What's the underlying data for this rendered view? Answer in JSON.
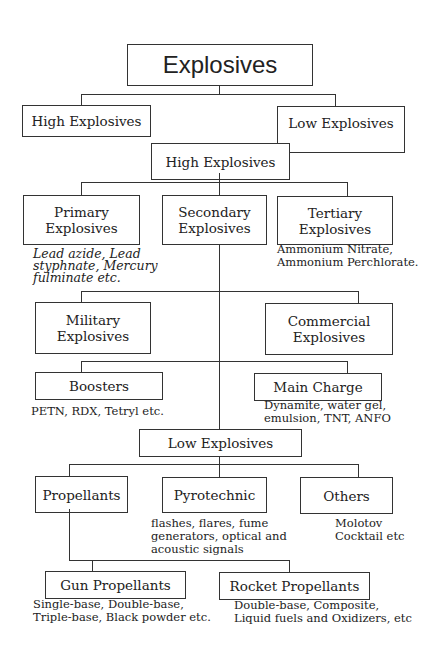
{
  "diagram": {
    "root": "Explosives",
    "level1": {
      "high": "High Explosives",
      "low": "Low Explosives"
    },
    "high_section": {
      "header": "High Explosives",
      "primary": {
        "line1": "Primary",
        "line2": "Explosives",
        "examples": [
          "Lead azide, Lead",
          "styphnate, Mercury",
          "fulminate etc."
        ]
      },
      "secondary": {
        "line1": "Secondary",
        "line2": "Explosives"
      },
      "tertiary": {
        "line1": "Tertiary",
        "line2": "Explosives",
        "examples": [
          "Ammonium Nitrate,",
          "Ammonium Perchlorate."
        ]
      },
      "military": {
        "line1": "Military",
        "line2": "Explosives"
      },
      "commercial": {
        "line1": "Commercial",
        "line2": "Explosives"
      },
      "boosters": {
        "label": "Boosters",
        "examples": [
          "PETN, RDX, Tetryl etc."
        ]
      },
      "main_charge": {
        "label": "Main Charge",
        "examples": [
          "Dynamite, water gel,",
          "emulsion, TNT, ANFO"
        ]
      }
    },
    "low_section": {
      "header": "Low Explosives",
      "propellants": {
        "label": "Propellants"
      },
      "pyrotechnic": {
        "label": "Pyrotechnic",
        "examples": [
          "flashes, flares, fume",
          "generators, optical and",
          "acoustic signals"
        ]
      },
      "others": {
        "label": "Others",
        "examples": [
          "Molotov",
          "Cocktail etc"
        ]
      },
      "gun_propellants": {
        "label": "Gun Propellants",
        "examples": [
          "Single-base, Double-base,",
          "Triple-base, Black powder etc."
        ]
      },
      "rocket_propellants": {
        "label": "Rocket Propellants",
        "examples": [
          "Double-base, Composite,",
          "Liquid fuels and Oxidizers, etc"
        ]
      }
    }
  }
}
